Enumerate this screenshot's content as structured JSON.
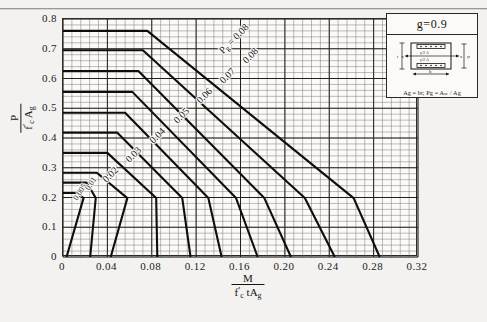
{
  "figure": {
    "g_value": "g=0.9",
    "legend_note": "Ag = bt; Pg = Aₛₜ / Ag",
    "legend_fig_labels": {
      "left": "t",
      "bottom": "b",
      "x_left": "x",
      "x_right": "x",
      "bar_top": "γ/2 Aₛₜ",
      "bar_bottom": "γ/2 Aₛₜ",
      "right": "γt"
    }
  },
  "axes": {
    "y_title_num": "P",
    "y_title_den_a": "f",
    "y_title_den_b": "A",
    "y_title_den_sub": "g",
    "x_title_num": "M",
    "x_title_den_a": "f",
    "x_title_den_b": "tA",
    "x_title_den_sub": "g",
    "y_ticks": [
      "0.8",
      "0.7",
      "0.6",
      "0.5",
      "0.4",
      "0.3",
      "0.2",
      "0.1",
      "0"
    ],
    "y_tick_values": [
      0.8,
      0.7,
      0.6,
      0.5,
      0.4,
      0.3,
      0.2,
      0.1,
      0
    ],
    "x_ticks": [
      "0",
      "0.04",
      "0.08",
      "0.12",
      "0.16",
      "0.20",
      "0.24",
      "0.28",
      "0.32"
    ],
    "x_tick_values": [
      0,
      0.04,
      0.08,
      0.12,
      0.16,
      0.2,
      0.24,
      0.28,
      0.32
    ]
  },
  "chart_data": {
    "type": "line",
    "title": "",
    "subtitle": "",
    "xlabel": "M / (f'c t Ag)",
    "ylabel": "P / (f'c Ag)",
    "xlim": [
      0,
      0.32
    ],
    "ylim": [
      0,
      0.8
    ],
    "grid": true,
    "grid_major_x": 0.04,
    "grid_major_y": 0.1,
    "grid_minor_x": 0.008,
    "grid_minor_y": 0.02,
    "legend_position": "inline-curve-labels",
    "annotation": "g=0.9",
    "series": [
      {
        "name": "0.005",
        "label": "0.005",
        "label_x": 0.0115,
        "label_y": 0.205,
        "label_rot": -57,
        "points": [
          [
            0.0,
            0.215
          ],
          [
            0.0125,
            0.215
          ],
          [
            0.0185,
            0.198
          ],
          [
            0.0032,
            0.0
          ]
        ]
      },
      {
        "name": "0.01",
        "label": "0.01",
        "label_x": 0.0225,
        "label_y": 0.238,
        "label_rot": -57,
        "points": [
          [
            0.0,
            0.25
          ],
          [
            0.0215,
            0.25
          ],
          [
            0.0295,
            0.198
          ],
          [
            0.0245,
            0.0
          ]
        ]
      },
      {
        "name": "0.02",
        "label": "0.02",
        "label_x": 0.0375,
        "label_y": 0.272,
        "label_rot": -45,
        "points": [
          [
            0.0,
            0.283
          ],
          [
            0.0305,
            0.283
          ],
          [
            0.058,
            0.198
          ],
          [
            0.043,
            0.0
          ]
        ]
      },
      {
        "name": "0.03",
        "label": "0.03",
        "label_x": 0.0585,
        "label_y": 0.338,
        "label_rot": -45,
        "points": [
          [
            0.0,
            0.35
          ],
          [
            0.04,
            0.35
          ],
          [
            0.084,
            0.198
          ],
          [
            0.085,
            0.0
          ]
        ]
      },
      {
        "name": "0.04",
        "label": "0.04",
        "label_x": 0.08,
        "label_y": 0.405,
        "label_rot": -45,
        "points": [
          [
            0.0,
            0.418
          ],
          [
            0.049,
            0.418
          ],
          [
            0.1075,
            0.198
          ],
          [
            0.115,
            0.0
          ]
        ]
      },
      {
        "name": "0.05",
        "label": "0.05",
        "label_x": 0.102,
        "label_y": 0.47,
        "label_rot": -45,
        "points": [
          [
            0.0,
            0.485
          ],
          [
            0.056,
            0.485
          ],
          [
            0.131,
            0.198
          ],
          [
            0.143,
            0.0
          ]
        ]
      },
      {
        "name": "0.06",
        "label": "0.06",
        "label_x": 0.1225,
        "label_y": 0.538,
        "label_rot": -45,
        "points": [
          [
            0.0,
            0.555
          ],
          [
            0.0625,
            0.555
          ],
          [
            0.156,
            0.198
          ],
          [
            0.1755,
            0.0
          ]
        ]
      },
      {
        "name": "0.07",
        "label": "0.07",
        "label_x": 0.143,
        "label_y": 0.605,
        "label_rot": -45,
        "points": [
          [
            0.0,
            0.625
          ],
          [
            0.068,
            0.625
          ],
          [
            0.1815,
            0.198
          ],
          [
            0.2055,
            0.0
          ]
        ]
      },
      {
        "name": "0.08",
        "label": "0.08",
        "label_x": 0.164,
        "label_y": 0.672,
        "label_rot": -45,
        "points": [
          [
            0.0,
            0.695
          ],
          [
            0.072,
            0.695
          ],
          [
            0.218,
            0.198
          ],
          [
            0.245,
            0.0
          ]
        ]
      },
      {
        "name": "pg",
        "label": "P",
        "label_x": 0.1435,
        "label_y": 0.705,
        "label_rot": -45,
        "points": [
          [
            0.0,
            0.76
          ],
          [
            0.076,
            0.76
          ],
          [
            0.262,
            0.198
          ],
          [
            0.2855,
            0.0
          ]
        ]
      }
    ],
    "series_label_prefix": "P",
    "series_label_prefix_sub": "g",
    "series_label_eq": "=",
    "top_series_label": "0.08"
  }
}
